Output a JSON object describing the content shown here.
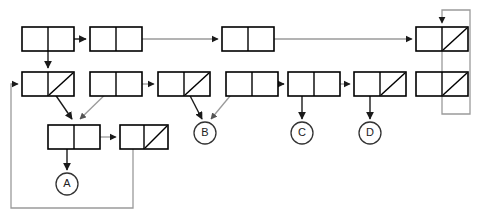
{
  "diagram": {
    "type": "box-and-pointer",
    "canvas": {
      "width": 480,
      "height": 221,
      "background": "#ffffff"
    },
    "colors": {
      "box_stroke": "#000000",
      "dark_edge": "#1a1a1a",
      "grey_edge": "#9a9a9a",
      "terminal_stroke": "#333333",
      "text": "#222222"
    },
    "cells": [
      {
        "id": "r1c1",
        "row": 1,
        "x": 22,
        "y": 27,
        "w": 52,
        "h": 24,
        "left": "pointer",
        "right": "pointer",
        "slash": false
      },
      {
        "id": "r1c2",
        "row": 1,
        "x": 90,
        "y": 27,
        "w": 52,
        "h": 24,
        "left": "empty",
        "right": "pointer",
        "slash": false
      },
      {
        "id": "r1c3",
        "row": 1,
        "x": 222,
        "y": 27,
        "w": 52,
        "h": 24,
        "left": "empty",
        "right": "pointer",
        "slash": false
      },
      {
        "id": "r1c4",
        "row": 1,
        "x": 416,
        "y": 27,
        "w": 52,
        "h": 24,
        "left": "pointer",
        "right": "nil",
        "slash": true
      },
      {
        "id": "r2c1",
        "row": 2,
        "x": 22,
        "y": 72,
        "w": 52,
        "h": 24,
        "left": "pointer",
        "right": "nil",
        "slash": true
      },
      {
        "id": "r2c2",
        "row": 2,
        "x": 90,
        "y": 72,
        "w": 52,
        "h": 24,
        "left": "pointer",
        "right": "pointer",
        "slash": false
      },
      {
        "id": "r2c3",
        "row": 2,
        "x": 158,
        "y": 72,
        "w": 52,
        "h": 24,
        "left": "pointer",
        "right": "nil",
        "slash": true
      },
      {
        "id": "r2c4",
        "row": 2,
        "x": 226,
        "y": 72,
        "w": 52,
        "h": 24,
        "left": "pointer",
        "right": "pointer",
        "slash": false
      },
      {
        "id": "r2c5",
        "row": 2,
        "x": 288,
        "y": 72,
        "w": 52,
        "h": 24,
        "left": "pointer",
        "right": "pointer",
        "slash": false
      },
      {
        "id": "r2c6",
        "row": 2,
        "x": 354,
        "y": 72,
        "w": 52,
        "h": 24,
        "left": "pointer",
        "right": "nil",
        "slash": true
      },
      {
        "id": "r2c7",
        "row": 2,
        "x": 416,
        "y": 72,
        "w": 52,
        "h": 24,
        "left": "pointer",
        "right": "nil",
        "slash": true
      },
      {
        "id": "r3c1",
        "row": 3,
        "x": 48,
        "y": 125,
        "w": 52,
        "h": 24,
        "left": "pointer",
        "right": "pointer",
        "slash": false
      },
      {
        "id": "r3c2",
        "row": 3,
        "x": 120,
        "y": 125,
        "w": 48,
        "h": 24,
        "left": "pointer",
        "right": "nil",
        "slash": true
      }
    ],
    "terminals": [
      {
        "id": "term-a",
        "label": "A",
        "cx": 67,
        "cy": 184,
        "r": 11
      },
      {
        "id": "term-b",
        "label": "B",
        "cx": 205,
        "cy": 133,
        "r": 11
      },
      {
        "id": "term-c",
        "label": "C",
        "cx": 302,
        "cy": 133,
        "r": 11
      },
      {
        "id": "term-d",
        "label": "D",
        "cx": 370,
        "cy": 133,
        "r": 11
      }
    ],
    "edges": [
      {
        "id": "e-r1c1-to-r1c2",
        "from": "r1c1",
        "to": "r1c2",
        "style": "dark",
        "kind": "horizontal"
      },
      {
        "id": "e-r1c2-to-r1c3",
        "from": "r1c2",
        "to": "r1c3",
        "style": "grey",
        "kind": "horizontal"
      },
      {
        "id": "e-r1c3-to-r1c4",
        "from": "r1c3",
        "to": "r1c4",
        "style": "grey",
        "kind": "horizontal"
      },
      {
        "id": "e-r1c1-to-r2c1",
        "from": "r1c1",
        "to": "r2c1",
        "style": "dark",
        "kind": "vertical"
      },
      {
        "id": "e-r2c2-to-r2c3",
        "from": "r2c2",
        "to": "r2c3",
        "style": "grey",
        "kind": "horizontal"
      },
      {
        "id": "e-r2c4-to-r2c5",
        "from": "r2c4",
        "to": "r2c5",
        "style": "dark",
        "kind": "horizontal"
      },
      {
        "id": "e-r2c5-to-r2c6",
        "from": "r2c5",
        "to": "r2c6",
        "style": "dark",
        "kind": "horizontal"
      },
      {
        "id": "e-r1c4-to-r2c7",
        "from": "r1c4",
        "to": "r2c7",
        "style": "grey",
        "kind": "vertical"
      },
      {
        "id": "e-r2c7-loopback",
        "from": "r2c7",
        "to": "r1c4",
        "style": "grey",
        "kind": "loop-right"
      },
      {
        "id": "e-r2c1-to-r3c1",
        "from": "r2c1",
        "to": "r3c1",
        "style": "dark",
        "kind": "diagonal"
      },
      {
        "id": "e-r2c2-to-r3c1",
        "from": "r2c2",
        "to": "r3c1",
        "style": "grey",
        "kind": "diagonal"
      },
      {
        "id": "e-r2c3-to-termb",
        "from": "r2c3",
        "to": "term-b",
        "style": "dark",
        "kind": "diagonal"
      },
      {
        "id": "e-r2c4-to-termb",
        "from": "r2c4",
        "to": "term-b",
        "style": "grey",
        "kind": "diagonal"
      },
      {
        "id": "e-r2c5-to-termc",
        "from": "r2c5",
        "to": "term-c",
        "style": "dark",
        "kind": "vertical"
      },
      {
        "id": "e-r2c6-to-termd",
        "from": "r2c6",
        "to": "term-d",
        "style": "dark",
        "kind": "vertical"
      },
      {
        "id": "e-r3c1-to-r3c2",
        "from": "r3c1",
        "to": "r3c2",
        "style": "grey",
        "kind": "horizontal"
      },
      {
        "id": "e-r3c1-to-terma",
        "from": "r3c1",
        "to": "term-a",
        "style": "dark",
        "kind": "vertical"
      },
      {
        "id": "e-r3c2-loopback",
        "from": "r3c2",
        "to": "r2c1",
        "style": "grey",
        "kind": "loop-left"
      }
    ]
  }
}
